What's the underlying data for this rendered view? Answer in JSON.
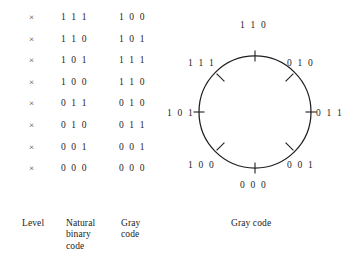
{
  "figure": {
    "background_color": "#ffffff",
    "ink_color": "#242424"
  },
  "table": {
    "level_marker": "×",
    "headers": {
      "level": "Level",
      "natural_binary": "Natural\nbinary\ncode",
      "gray": "Gray\ncode"
    },
    "rows": [
      {
        "level": "×",
        "natural_binary": "1 1 1",
        "gray": "1 0 0"
      },
      {
        "level": "×",
        "natural_binary": "1 1 0",
        "gray": "1 0 1"
      },
      {
        "level": "×",
        "natural_binary": "1 0 1",
        "gray": "1 1 1"
      },
      {
        "level": "×",
        "natural_binary": "1 0 0",
        "gray": "1 1 0"
      },
      {
        "level": "×",
        "natural_binary": "0 1 1",
        "gray": "0 1 0"
      },
      {
        "level": "×",
        "natural_binary": "0 1 0",
        "gray": "0 1 1"
      },
      {
        "level": "×",
        "natural_binary": "0 0 1",
        "gray": "0 0 1"
      },
      {
        "level": "×",
        "natural_binary": "0 0 0",
        "gray": "0 0 0"
      }
    ]
  },
  "circle": {
    "caption": "Gray code",
    "center_x": 90,
    "center_y": 112,
    "radius": 56,
    "labels": [
      {
        "code": "1 1 0",
        "angle_deg": 90,
        "position": "top"
      },
      {
        "code": "0 1 0",
        "angle_deg": 45,
        "position": "upper-right"
      },
      {
        "code": "0 1 1",
        "angle_deg": 0,
        "position": "right"
      },
      {
        "code": "0 0 1",
        "angle_deg": -45,
        "position": "lower-right"
      },
      {
        "code": "0 0 0",
        "angle_deg": -90,
        "position": "bottom"
      },
      {
        "code": "1 0 0",
        "angle_deg": 225,
        "position": "lower-left"
      },
      {
        "code": "1 0 1",
        "angle_deg": 180,
        "position": "left"
      },
      {
        "code": "1 1 1",
        "angle_deg": 135,
        "position": "upper-left"
      }
    ],
    "tick_count": 8
  }
}
